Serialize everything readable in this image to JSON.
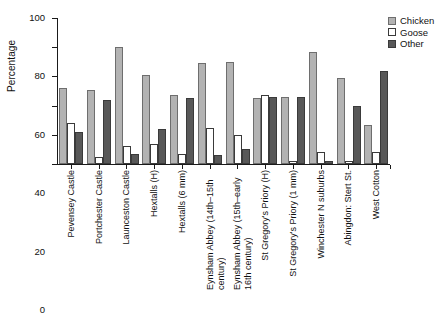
{
  "chart_data": {
    "type": "bar",
    "title": "",
    "xlabel": "",
    "ylabel": "Percentage",
    "ylim": [
      0,
      100
    ],
    "yticks": [
      0,
      20,
      40,
      60,
      80,
      100
    ],
    "grid": false,
    "legend_position": "top-right",
    "categories": [
      "Pevensey Castle",
      "Portchester Castle",
      "Launceston Castle",
      "Hextalls (H)",
      "Hextalls (6 mm)",
      "Eynsham Abbey (14th–15th century)",
      "Eynsham Abbey (15th–early 16th century)",
      "St Gregory's Priory (H)",
      "St Gregory's Priory (1 mm)",
      "Winchester N suburbs",
      "Abingdon: Stert St.",
      "West Cotton"
    ],
    "series": [
      {
        "name": "Chicken",
        "color": "#b3b3b3",
        "values": [
          52,
          51,
          80,
          61,
          47,
          69,
          70,
          45,
          46,
          77,
          59,
          27
        ]
      },
      {
        "name": "Goose",
        "color": "#ffffff",
        "values": [
          28,
          5,
          12,
          14,
          7,
          25,
          20,
          47,
          2,
          8,
          2,
          8
        ]
      },
      {
        "name": "Other",
        "color": "#585858",
        "values": [
          22,
          44,
          7,
          24,
          45,
          6,
          10,
          46,
          46,
          2,
          40,
          64
        ]
      }
    ]
  },
  "legend": {
    "items": [
      {
        "label": "Chicken"
      },
      {
        "label": "Goose"
      },
      {
        "label": "Other"
      }
    ]
  },
  "caption": {
    "text": ""
  }
}
